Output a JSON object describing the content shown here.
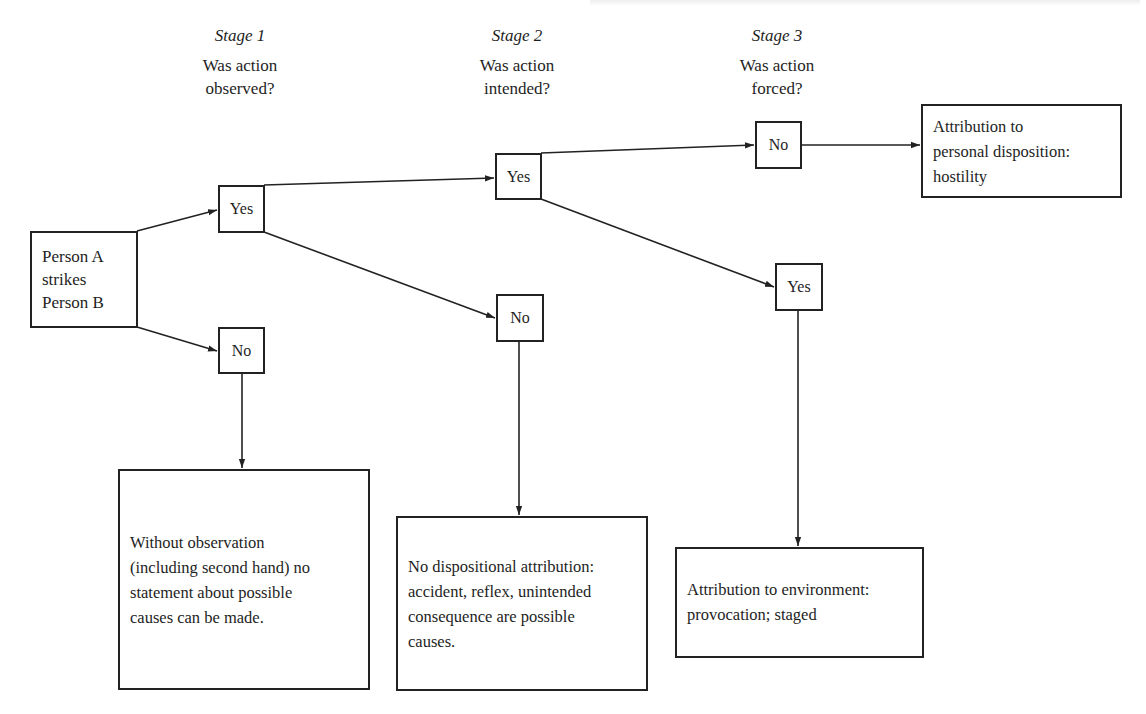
{
  "diagram": {
    "type": "attribution-decision-tree",
    "stages": [
      {
        "title": "Stage 1",
        "question": "Was action\nobserved?"
      },
      {
        "title": "Stage 2",
        "question": "Was action\nintended?"
      },
      {
        "title": "Stage 3",
        "question": "Was action\nforced?"
      }
    ],
    "start_node": {
      "label": "Person A\nstrikes\nPerson B"
    },
    "decision_nodes": {
      "stage1_yes": "Yes",
      "stage1_no": "No",
      "stage2_yes": "Yes",
      "stage2_no": "No",
      "stage3_no": "No",
      "stage3_yes": "Yes"
    },
    "outcomes": {
      "hostility": "Attribution to\npersonal disposition:\nhostility",
      "not_observed": "Without observation\n(including second hand) no\nstatement about possible\ncauses can be made.",
      "not_intended": "No dispositional attribution:\naccident, reflex, unintended\nconsequence are possible\ncauses.",
      "environment": "Attribution to environment:\nprovocation; staged"
    },
    "edges": [
      {
        "from": "start",
        "to": "stage1_yes"
      },
      {
        "from": "start",
        "to": "stage1_no"
      },
      {
        "from": "stage1_no",
        "to": "not_observed"
      },
      {
        "from": "stage1_yes",
        "to": "stage2_yes"
      },
      {
        "from": "stage1_yes",
        "to": "stage2_no"
      },
      {
        "from": "stage2_no",
        "to": "not_intended"
      },
      {
        "from": "stage2_yes",
        "to": "stage3_no"
      },
      {
        "from": "stage2_yes",
        "to": "stage3_yes"
      },
      {
        "from": "stage3_no",
        "to": "hostility"
      },
      {
        "from": "stage3_yes",
        "to": "environment"
      }
    ],
    "colors": {
      "line": "#222222",
      "background": "#ffffff",
      "text": "#1e1e1e"
    }
  }
}
